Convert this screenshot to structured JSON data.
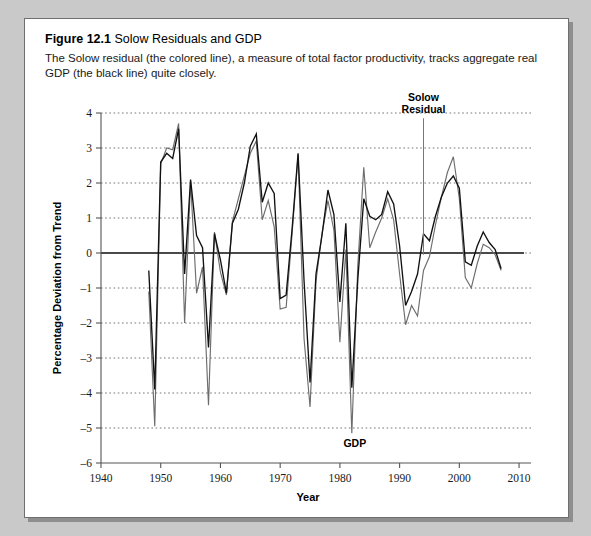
{
  "figure": {
    "number": "Figure 12.1",
    "name": "Solow Residuals and GDP",
    "caption": "The Solow residual (the colored line), a measure of total factor productivity, tracks aggregate real GDP (the black line) quite closely."
  },
  "colors": {
    "page_background": "#c9c9c9",
    "figure_background": "#ffffff",
    "figure_border": "#6f6f6f",
    "gdp_line": "#111111",
    "solow_line": "#6d6d6d",
    "grid": "#777777",
    "zero_axis": "#4a4a4a"
  },
  "annotations": {
    "solow_label_line1": "Solow",
    "solow_label_line2": "Residual",
    "gdp_label": "GDP"
  },
  "chart_data": {
    "type": "line",
    "title": "Solow Residuals and GDP",
    "xlabel": "Year",
    "ylabel": "Percentage Deviation from Trend",
    "xlim": [
      1940,
      2012
    ],
    "ylim": [
      -6,
      4
    ],
    "xticks": [
      1940,
      1950,
      1960,
      1970,
      1980,
      1990,
      2000,
      2010
    ],
    "yticks": [
      -6,
      -5,
      -4,
      -3,
      -2,
      -1,
      0,
      1,
      2,
      3,
      4
    ],
    "grid": true,
    "legend": "annotated-inline",
    "x": [
      1948,
      1949,
      1950,
      1951,
      1952,
      1953,
      1954,
      1955,
      1956,
      1957,
      1958,
      1959,
      1960,
      1961,
      1962,
      1963,
      1964,
      1965,
      1966,
      1967,
      1968,
      1969,
      1970,
      1971,
      1972,
      1973,
      1974,
      1975,
      1976,
      1977,
      1978,
      1979,
      1980,
      1981,
      1982,
      1983,
      1984,
      1985,
      1986,
      1987,
      1988,
      1989,
      1990,
      1991,
      1992,
      1993,
      1994,
      1995,
      1996,
      1997,
      1998,
      1999,
      2000,
      2001,
      2002,
      2003,
      2004,
      2005,
      2006,
      2007
    ],
    "series": [
      {
        "name": "GDP",
        "color": "#111111",
        "values": [
          -0.5,
          -3.9,
          2.6,
          2.85,
          2.7,
          3.55,
          -0.6,
          2.1,
          0.5,
          0.15,
          -2.7,
          0.55,
          -0.2,
          -1.15,
          0.85,
          1.25,
          2.0,
          3.05,
          3.4,
          1.45,
          2.0,
          1.7,
          -1.3,
          -1.2,
          0.7,
          2.85,
          -0.8,
          -3.7,
          -0.6,
          0.5,
          1.8,
          1.1,
          -1.4,
          0.85,
          -3.85,
          -0.75,
          1.55,
          1.05,
          0.95,
          1.1,
          1.75,
          1.4,
          0.2,
          -1.5,
          -1.1,
          -0.6,
          0.55,
          0.35,
          1.05,
          1.6,
          2.0,
          2.2,
          1.85,
          -0.25,
          -0.35,
          0.2,
          0.6,
          0.3,
          0.1,
          -0.45
        ],
        "note": "black line, real GDP percentage deviation from trend"
      },
      {
        "name": "Solow Residual",
        "color": "#6d6d6d",
        "values": [
          -1.1,
          -4.95,
          2.55,
          3.0,
          2.95,
          3.7,
          -2.0,
          2.05,
          -1.15,
          -0.4,
          -4.35,
          0.6,
          -0.55,
          -1.2,
          0.9,
          1.55,
          2.2,
          2.85,
          3.2,
          0.95,
          1.5,
          0.75,
          -1.6,
          -1.55,
          0.55,
          2.8,
          -2.45,
          -4.4,
          -0.8,
          0.55,
          1.5,
          0.65,
          -2.55,
          0.1,
          -5.15,
          -0.35,
          2.45,
          0.15,
          0.6,
          1.0,
          1.55,
          0.95,
          -0.6,
          -2.05,
          -1.5,
          -1.8,
          -0.5,
          -0.1,
          0.8,
          1.6,
          2.3,
          2.75,
          1.55,
          -0.7,
          -1.0,
          -0.3,
          0.25,
          0.15,
          -0.05,
          -0.5
        ],
        "note": "colored (gray) line, Solow residual / total factor productivity"
      }
    ]
  }
}
